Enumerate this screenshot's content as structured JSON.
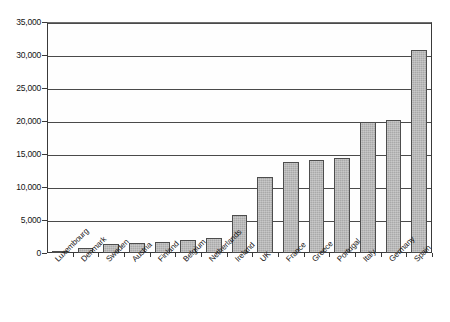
{
  "chart_data": {
    "type": "bar",
    "title": "",
    "subtitle": "",
    "xlabel": "",
    "ylabel": "",
    "ylim": [
      0,
      35000
    ],
    "grid": true,
    "legend": false,
    "legend_position": "none",
    "orientation": "vertical",
    "bar_color": "#a9a9a9",
    "bar_border_color": "#4d4d4d",
    "axis_color": "#3a3a3a",
    "gridline_color": "#4a4a4a",
    "background_color": "#ffffff",
    "ytick_labels": [
      "0",
      "5,000",
      "10,000",
      "15,000",
      "20,000",
      "25,000",
      "30,000",
      "35,000"
    ],
    "ytick_values": [
      0,
      5000,
      10000,
      15000,
      20000,
      25000,
      30000,
      35000
    ],
    "categories": [
      "Luxembourg",
      "Denmark",
      "Sweden",
      "Austria",
      "Finland",
      "Belgium",
      "Netherlands",
      "Ireland",
      "UK",
      "France",
      "Greece",
      "Portugal",
      "Italy",
      "Germany",
      "Spain"
    ],
    "values": [
      120,
      800,
      1300,
      1550,
      1650,
      1950,
      2300,
      5800,
      11500,
      13750,
      14100,
      14350,
      19800,
      20100,
      30800
    ]
  }
}
